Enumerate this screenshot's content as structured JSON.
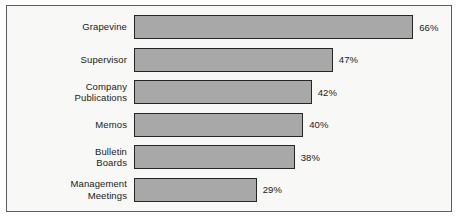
{
  "chart_data": {
    "type": "bar",
    "orientation": "horizontal",
    "title": "",
    "subtitle": "",
    "xlabel": "",
    "ylabel": "",
    "xlim": [
      0,
      100
    ],
    "grid": false,
    "legend": null,
    "value_suffix": "%",
    "categories": [
      "Grapevine",
      "Supervisor",
      "Company\nPublications",
      "Memos",
      "Bulletin\nBoards",
      "Management\nMeetings"
    ],
    "values": [
      66,
      47,
      42,
      40,
      38,
      29
    ],
    "value_labels": [
      "66%",
      "47%",
      "42%",
      "40%",
      "38%",
      "29%"
    ],
    "colors": {
      "bar_fill": "#a8a8a8",
      "bar_border": "#262626",
      "frame_border": "#5e5e5e",
      "background": "#f8f8f6",
      "text": "#1a1a1a"
    },
    "scale_px_per_unit": 4.23
  }
}
